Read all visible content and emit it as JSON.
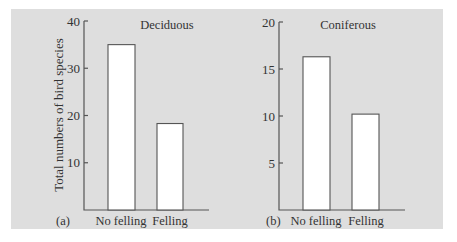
{
  "figure": {
    "background_color": "#dedede",
    "bar_fill": "#ffffff",
    "ylabel": "Total numbers of bird species"
  },
  "chart_data": [
    {
      "type": "bar",
      "panel_label": "(a)",
      "title": "Deciduous",
      "categories": [
        "No felling",
        "Felling"
      ],
      "values": [
        35,
        18.3
      ],
      "xlabel": "",
      "ylabel": "Total numbers of bird species",
      "ylim": [
        0,
        40
      ],
      "yticks": [
        10,
        20,
        30,
        40
      ],
      "grid": false
    },
    {
      "type": "bar",
      "panel_label": "(b)",
      "title": "Coniferous",
      "categories": [
        "No felling",
        "Felling"
      ],
      "values": [
        16.3,
        10.2
      ],
      "xlabel": "",
      "ylabel": "",
      "ylim": [
        0,
        20
      ],
      "yticks": [
        5,
        10,
        15,
        20
      ],
      "grid": false
    }
  ]
}
